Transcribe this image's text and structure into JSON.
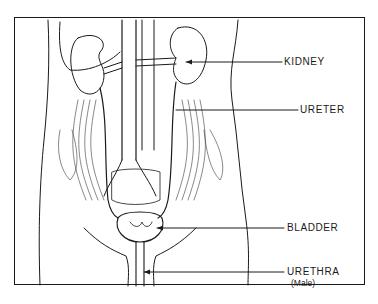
{
  "diagram": {
    "line_color": "#1a1a1a",
    "background": "#ffffff",
    "labels": [
      {
        "id": "kidney",
        "text": "KIDNEY"
      },
      {
        "id": "ureter",
        "text": "URETER"
      },
      {
        "id": "bladder",
        "text": "BLADDER"
      },
      {
        "id": "urethra",
        "text": "URETHRA",
        "note": "(Male)"
      }
    ]
  }
}
